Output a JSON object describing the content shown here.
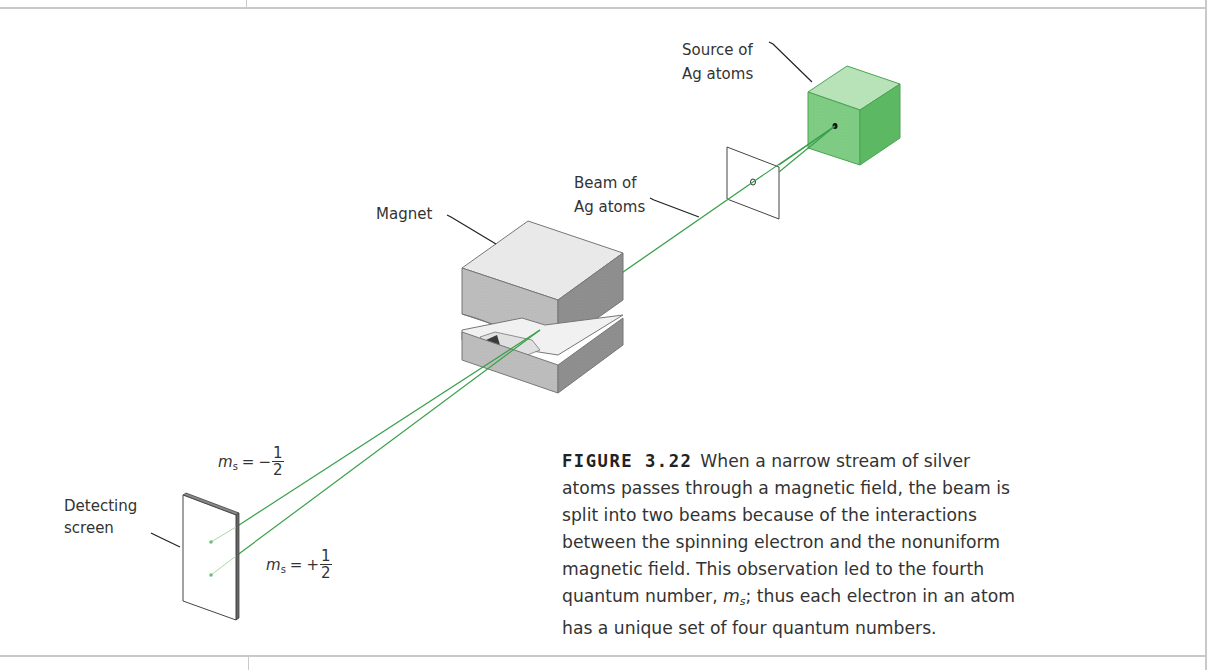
{
  "figure": {
    "number_label": "FIGURE 3.22",
    "caption_part1": "When a narrow stream of silver atoms passes through a magnetic field, the beam is split into two beams because of the interactions between the spinning electron and the nonuniform magnetic field. This observation led to the fourth quantum number, ",
    "caption_symbol": "m",
    "caption_symbol_sub": "s",
    "caption_part2": "; thus each electron in an atom has a unique set of four quantum numbers."
  },
  "labels": {
    "source_line1": "Source of",
    "source_line2": "Ag atoms",
    "beam_line1": "Beam of",
    "beam_line2": "Ag atoms",
    "magnet": "Magnet",
    "screen_line1": "Detecting",
    "screen_line2": "screen"
  },
  "spin_labels": {
    "upper": {
      "symbol": "m",
      "sub": "s",
      "eq": "=",
      "sign": "−",
      "num": "1",
      "den": "2"
    },
    "lower": {
      "symbol": "m",
      "sub": "s",
      "eq": "=",
      "sign": "+",
      "num": "1",
      "den": "2"
    }
  },
  "colors": {
    "beam": "#3aa04a",
    "source_front": "#7fcc84",
    "source_top": "#b8e3b8",
    "source_side": "#5cb863",
    "magnet_top": "#e9e9e9",
    "magnet_front": "#bdbdbd",
    "magnet_side": "#8f8f8f",
    "frame": "#c9c9c9"
  }
}
